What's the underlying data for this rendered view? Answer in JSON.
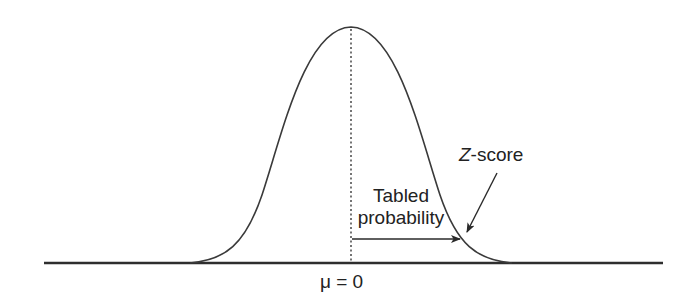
{
  "diagram": {
    "type": "normal-distribution-curve",
    "labels": {
      "tabled_line1": "Tabled",
      "tabled_line2": "probability",
      "zscore_z": "Z",
      "zscore_rest": "-score",
      "mean": "μ = 0"
    },
    "elements": {
      "curve": "bell-shaped normal curve",
      "mean_line": "dotted vertical line at mean",
      "probability_arrow": "horizontal arrow from mean to Z-score",
      "zscore_pointer": "diagonal arrow pointing to Z-score on curve",
      "baseline": "horizontal axis"
    },
    "colors": {
      "stroke": "#3a3a3a",
      "text": "#222222",
      "background": "#ffffff"
    }
  }
}
